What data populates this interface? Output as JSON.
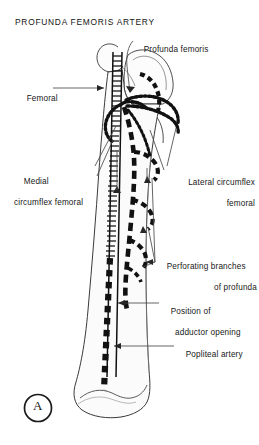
{
  "figure": {
    "title": "PROFUNDA FEMORIS ARTERY",
    "panel_letter": "A",
    "colors": {
      "ink": "#181818",
      "bone_fill": "#fbfbfb",
      "bone_outline": "#3a3a3a",
      "leader_line": "#4a4a4a",
      "background": "#ffffff"
    }
  },
  "labels": {
    "profunda_femoris": {
      "line1": "Profunda femoris",
      "line2": ""
    },
    "femoral": {
      "line1": "Femoral",
      "line2": ""
    },
    "medial_circumflex_femoral": {
      "line1": "Medial",
      "line2": "circumflex femoral"
    },
    "lateral_circumflex_femoral": {
      "line1": "Lateral circumflex",
      "line2": "femoral"
    },
    "perforating_branches": {
      "line1": "Perforating branches",
      "line2": "of profunda"
    },
    "position_adductor_opening": {
      "line1": "Position of",
      "line2": "adductor opening"
    },
    "popliteal_artery": {
      "line1": "Popliteal artery",
      "line2": ""
    }
  },
  "vessel_styles": {
    "femoral": "ladder-rungs",
    "profunda_femoris": "thick-dash",
    "circumflex": "beaded-dotted",
    "perforating": "beaded-dotted",
    "popliteal": "thick-square-dash"
  }
}
